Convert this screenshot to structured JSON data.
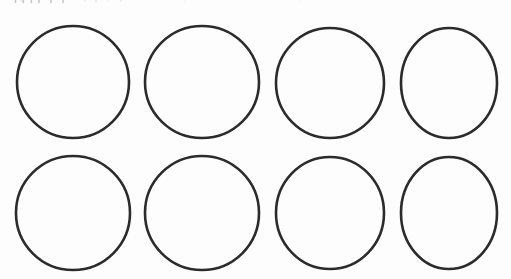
{
  "page": {
    "width": 511,
    "height": 279,
    "background_color": "#fdfdfd",
    "document_type": "worksheet-scan",
    "clipped_heading_text": "pppp p p"
  },
  "worksheet": {
    "title": "",
    "shape_name": "circle",
    "shape_count": 8,
    "grid_rows": 2,
    "grid_columns": 4,
    "stroke_color": "#2b2b2d",
    "stroke_width": 2.6,
    "fill_color": "none",
    "circles": [
      {
        "id": "circle-r1c1",
        "row": 1,
        "column": 1,
        "cx": 73,
        "cy": 82,
        "rx": 56,
        "ry": 56
      },
      {
        "id": "circle-r1c2",
        "row": 1,
        "column": 2,
        "cx": 202,
        "cy": 82,
        "rx": 57,
        "ry": 56
      },
      {
        "id": "circle-r1c3",
        "row": 1,
        "column": 3,
        "cx": 330,
        "cy": 83,
        "rx": 54,
        "ry": 55
      },
      {
        "id": "circle-r1c4",
        "row": 1,
        "column": 4,
        "cx": 449,
        "cy": 83,
        "rx": 48,
        "ry": 55
      },
      {
        "id": "circle-r2c1",
        "row": 2,
        "column": 1,
        "cx": 73,
        "cy": 213,
        "rx": 57,
        "ry": 57
      },
      {
        "id": "circle-r2c2",
        "row": 2,
        "column": 2,
        "cx": 202,
        "cy": 213,
        "rx": 57,
        "ry": 57
      },
      {
        "id": "circle-r2c3",
        "row": 2,
        "column": 3,
        "cx": 330,
        "cy": 213,
        "rx": 54,
        "ry": 56
      },
      {
        "id": "circle-r2c4",
        "row": 2,
        "column": 4,
        "cx": 449,
        "cy": 213,
        "rx": 48,
        "ry": 56
      }
    ]
  },
  "scan_artifacts": {
    "specks": [
      {
        "x": 20,
        "y": 0,
        "size": 2
      },
      {
        "x": 84,
        "y": 0,
        "size": 2
      },
      {
        "x": 95,
        "y": 0,
        "size": 2
      },
      {
        "x": 108,
        "y": 0,
        "size": 1
      },
      {
        "x": 120,
        "y": 0,
        "size": 2
      },
      {
        "x": 184,
        "y": 1,
        "size": 1
      },
      {
        "x": 300,
        "y": 1,
        "size": 1
      }
    ]
  }
}
